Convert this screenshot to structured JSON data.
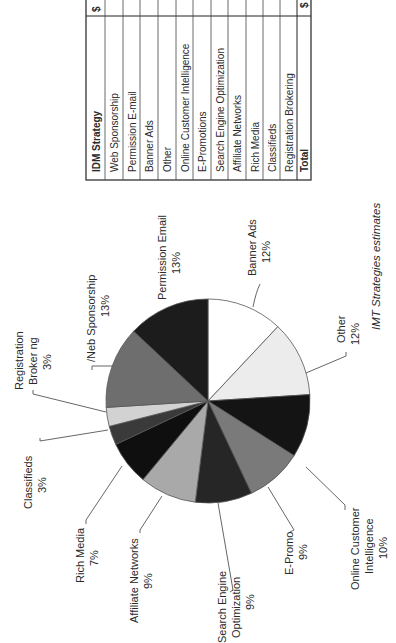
{
  "chart_data": {
    "type": "pie",
    "title": "",
    "orientation": "rotated 90 degrees clockwise",
    "slices": [
      {
        "label": "Permission Email",
        "value": 13,
        "label_lines": [
          "Permission Email",
          "13%"
        ],
        "color": "#1c1c1c"
      },
      {
        "label": "Banner Ads",
        "value": 12,
        "label_lines": [
          "Banner Ads",
          "12%"
        ],
        "color": "#ffffff"
      },
      {
        "label": "Other",
        "value": 12,
        "label_lines": [
          "Other",
          "12%"
        ],
        "color": "#ececec"
      },
      {
        "label": "Online Customer Intelligence",
        "value": 10,
        "label_lines": [
          "Online Customer",
          "Intelligence",
          "10%"
        ],
        "color": "#141414"
      },
      {
        "label": "E-Promo",
        "value": 9,
        "label_lines": [
          "E-Promo",
          "9%"
        ],
        "color": "#7a7a7a"
      },
      {
        "label": "Search Engine Optimization",
        "value": 9,
        "label_lines": [
          "Search Engine",
          "Optimization",
          "9%"
        ],
        "color": "#262626"
      },
      {
        "label": "Affiliate Networks",
        "value": 9,
        "label_lines": [
          "Affiliate Networks",
          "9%"
        ],
        "color": "#a9a9a9"
      },
      {
        "label": "Rich Media",
        "value": 7,
        "label_lines": [
          "Rich Media",
          "7%"
        ],
        "color": "#0f0f0f"
      },
      {
        "label": "Classifieds",
        "value": 3,
        "label_lines": [
          "Classifieds",
          "3%"
        ],
        "color": "#3a3a3a"
      },
      {
        "label": "Registration Brokering",
        "value": 3,
        "label_lines": [
          "Registration",
          "Broker ng",
          "3%"
        ],
        "color": "#d2d2d2"
      },
      {
        "label": "Web Sponsorship",
        "value": 13,
        "label_lines": [
          "Web Sponsorship",
          "13%"
        ],
        "display_text": "/Neb Sponsorship",
        "color": "#6e6e6e"
      }
    ],
    "unit": "%"
  },
  "table": {
    "header": {
      "strategy": "IDM Strategy",
      "amount": "$"
    },
    "rows": [
      "Web Sponsorship",
      "Permission E-mail",
      "Banner Ads",
      "Other",
      "Online Customer Intelligence",
      "E-Promotions",
      "Search Engine Optimization",
      "Affiliate Networks",
      "Rich Media",
      "Classifieds",
      "Registration Brokering"
    ],
    "total_label": "Total",
    "total_amount": "$"
  },
  "source": "IMT Strategies estimates"
}
